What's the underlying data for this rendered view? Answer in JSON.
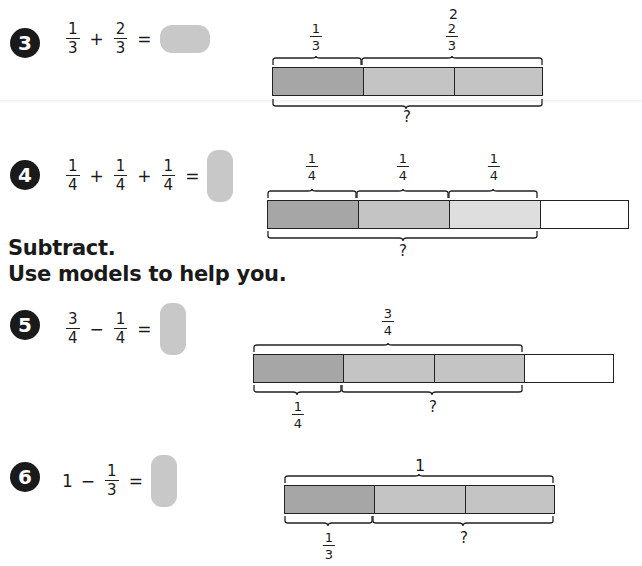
{
  "top_fragment": "2",
  "section_heading": {
    "line1": "Subtract.",
    "line2": "Use models to help you."
  },
  "problems": [
    {
      "number": "3",
      "equation": [
        {
          "n": "1",
          "d": "3"
        },
        "+",
        {
          "n": "2",
          "d": "3"
        },
        "="
      ],
      "model": {
        "segments": [
          "dark",
          "mid",
          "mid"
        ],
        "top_labels": [
          {
            "n": "1",
            "d": "3"
          },
          {
            "n": "2",
            "d": "3"
          }
        ],
        "bottom_labels": [
          "?"
        ]
      }
    },
    {
      "number": "4",
      "equation": [
        {
          "n": "1",
          "d": "4"
        },
        "+",
        {
          "n": "1",
          "d": "4"
        },
        "+",
        {
          "n": "1",
          "d": "4"
        },
        "="
      ],
      "model": {
        "segments": [
          "dark",
          "mid",
          "light",
          "white"
        ],
        "top_labels": [
          {
            "n": "1",
            "d": "4"
          },
          {
            "n": "1",
            "d": "4"
          },
          {
            "n": "1",
            "d": "4"
          }
        ],
        "bottom_labels": [
          "?"
        ]
      }
    },
    {
      "number": "5",
      "equation": [
        {
          "n": "3",
          "d": "4"
        },
        "−",
        {
          "n": "1",
          "d": "4"
        },
        "="
      ],
      "model": {
        "segments": [
          "dark",
          "mid",
          "mid",
          "white"
        ],
        "top_labels": [
          {
            "n": "3",
            "d": "4"
          }
        ],
        "bottom_labels": [
          {
            "n": "1",
            "d": "4"
          },
          "?"
        ]
      }
    },
    {
      "number": "6",
      "equation": [
        "1",
        "−",
        {
          "n": "1",
          "d": "3"
        },
        "="
      ],
      "model": {
        "segments": [
          "dark",
          "mid",
          "mid"
        ],
        "top_labels": [
          "1"
        ],
        "bottom_labels": [
          {
            "n": "1",
            "d": "3"
          },
          "?"
        ]
      }
    }
  ],
  "colors": {
    "dark_segment": "#a6a6a6",
    "mid_segment": "#c4c4c4",
    "light_segment": "#dedede",
    "answer_box": "#c8c8c8",
    "badge": "#1a1a1a"
  }
}
